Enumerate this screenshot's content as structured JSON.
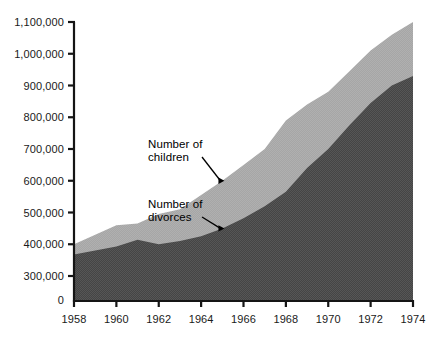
{
  "chart_data": {
    "type": "area",
    "title": "",
    "subtitle": "",
    "xlabel": "",
    "ylabel": "",
    "stacked": false,
    "grid": false,
    "legend_position": "inline-annotations",
    "axis_note": "y-axis is broken between 0 and 300,000",
    "xlim": [
      1958,
      1974
    ],
    "ylim": [
      300000,
      1100000
    ],
    "ytick_labels": [
      "1,100,000",
      "1,000,000",
      "900,000",
      "800,000",
      "700,000",
      "600,000",
      "500,000",
      "400,000",
      "300,000",
      "0"
    ],
    "ytick_values": [
      1100000,
      1000000,
      900000,
      800000,
      700000,
      600000,
      500000,
      400000,
      300000,
      0
    ],
    "xtick_labels": [
      "1958",
      "1960",
      "1962",
      "1964",
      "1966",
      "1968",
      "1970",
      "1972",
      "1974"
    ],
    "xtick_values": [
      1958,
      1960,
      1962,
      1964,
      1966,
      1968,
      1970,
      1972,
      1974
    ],
    "x": [
      1958,
      1959,
      1960,
      1961,
      1962,
      1963,
      1964,
      1965,
      1966,
      1967,
      1968,
      1969,
      1970,
      1971,
      1972,
      1973,
      1974
    ],
    "series": [
      {
        "name": "Number of children",
        "color": "#a9a9a9",
        "values": [
          400000,
          430000,
          460000,
          465000,
          495000,
          510000,
          555000,
          600000,
          650000,
          700000,
          790000,
          840000,
          880000,
          945000,
          1010000,
          1060000,
          1100000
        ]
      },
      {
        "name": "Number of divorces",
        "color": "#4a4a4a",
        "values": [
          368000,
          380000,
          393000,
          414000,
          400000,
          410000,
          425000,
          450000,
          482000,
          520000,
          565000,
          640000,
          700000,
          775000,
          845000,
          900000,
          930000
        ]
      }
    ],
    "annotations": [
      {
        "name": "children-annotation",
        "line1": "Number of",
        "line2": "children",
        "target_year": 1965.1,
        "target_value": 600000
      },
      {
        "name": "divorces-annotation",
        "line1": "Number of",
        "line2": "divorces",
        "target_year": 1965.1,
        "target_value": 450000
      }
    ]
  },
  "colors": {
    "axis": "#151515",
    "background": "#ffffff",
    "children_area": "#a9a9a9",
    "divorces_area": "#4a4a4a",
    "text": "#1a1a1a"
  }
}
